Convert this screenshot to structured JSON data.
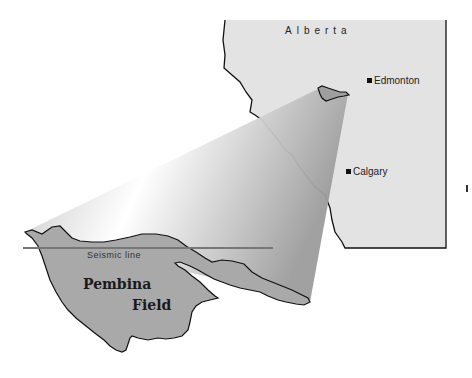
{
  "map": {
    "province_label": "Alberta",
    "cities": [
      {
        "name": "Edmonton",
        "marker": "square-marker"
      },
      {
        "name": "Calgary",
        "marker": "square-marker"
      }
    ],
    "seismic_label": "Seismic line",
    "field_label_line1": "Pembina",
    "field_label_line2": "Field",
    "colors": {
      "province_fill": "#e2e2e2",
      "field_fill": "#a8a8a8",
      "seismic_line": "#777777",
      "border": "#111111"
    }
  }
}
